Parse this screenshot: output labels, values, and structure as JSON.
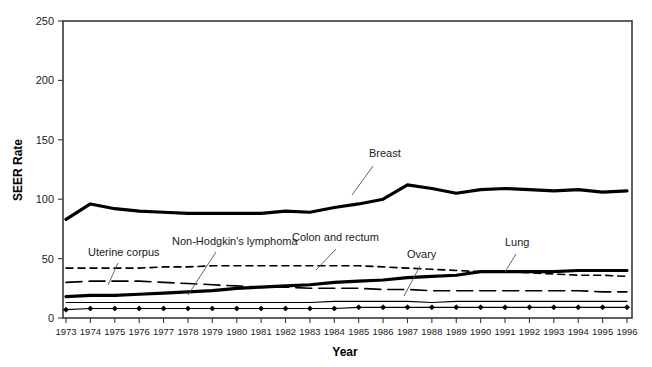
{
  "chart_data": {
    "type": "line",
    "title": "",
    "xlabel": "Year",
    "ylabel": "SEER Rate",
    "xlim": [
      1973,
      1996
    ],
    "ylim": [
      0,
      250
    ],
    "yticks": [
      0,
      50,
      100,
      150,
      200,
      250
    ],
    "grid": false,
    "legend_position": "inline-annotations",
    "x": [
      1973,
      1974,
      1975,
      1976,
      1977,
      1978,
      1979,
      1980,
      1981,
      1982,
      1983,
      1984,
      1985,
      1986,
      1987,
      1988,
      1989,
      1990,
      1991,
      1992,
      1993,
      1994,
      1995,
      1996
    ],
    "categories": [
      "1973",
      "1974",
      "1975",
      "1976",
      "1977",
      "1978",
      "1979",
      "1980",
      "1981",
      "1982",
      "1983",
      "1984",
      "1985",
      "1986",
      "1987",
      "1988",
      "1989",
      "1990",
      "1991",
      "1992",
      "1993",
      "1994",
      "1995",
      "1996"
    ],
    "series": [
      {
        "name": "Breast",
        "style": "thick-solid",
        "values": [
          83,
          96,
          92,
          90,
          89,
          88,
          88,
          88,
          88,
          90,
          89,
          93,
          96,
          100,
          112,
          109,
          105,
          108,
          109,
          108,
          107,
          108,
          106,
          107
        ]
      },
      {
        "name": "Colon and rectum",
        "style": "short-dash",
        "values": [
          42,
          42,
          42,
          42,
          43,
          43,
          44,
          44,
          44,
          44,
          44,
          44,
          44,
          43,
          42,
          41,
          40,
          39,
          39,
          38,
          37,
          36,
          36,
          35
        ]
      },
      {
        "name": "Lung",
        "style": "thick-solid",
        "values": [
          18,
          19,
          19,
          20,
          21,
          22,
          23,
          25,
          26,
          27,
          28,
          30,
          31,
          32,
          34,
          35,
          36,
          39,
          39,
          39,
          39,
          40,
          40,
          40
        ]
      },
      {
        "name": "Uterine corpus",
        "style": "long-dash",
        "values": [
          30,
          31,
          31,
          31,
          30,
          29,
          28,
          27,
          26,
          26,
          25,
          25,
          25,
          24,
          24,
          23,
          23,
          23,
          23,
          23,
          23,
          23,
          22,
          22
        ]
      },
      {
        "name": "Non-Hodgkin's lymphoma",
        "style": "thin-solid",
        "values": [
          13,
          13,
          13,
          13,
          13,
          13,
          13,
          13,
          13,
          13,
          13,
          14,
          14,
          14,
          14,
          13,
          14,
          14,
          14,
          14,
          14,
          14,
          14,
          14
        ]
      },
      {
        "name": "Ovary",
        "style": "diamond-solid",
        "values": [
          7,
          8,
          8,
          8,
          8,
          8,
          8,
          8,
          8,
          8,
          8,
          8,
          9,
          9,
          9,
          9,
          9,
          9,
          9,
          9,
          9,
          9,
          9,
          9
        ]
      }
    ],
    "annotations": [
      {
        "text": "Breast",
        "x": 369,
        "y": 157
      },
      {
        "text": "Non-Hodgkin's lymphoma",
        "x": 172,
        "y": 245
      },
      {
        "text": "Colon and rectum",
        "x": 292,
        "y": 241
      },
      {
        "text": "Ovary",
        "x": 407,
        "y": 258
      },
      {
        "text": "Lung",
        "x": 505,
        "y": 246
      },
      {
        "text": "Uterine corpus",
        "x": 88,
        "y": 256
      }
    ]
  }
}
